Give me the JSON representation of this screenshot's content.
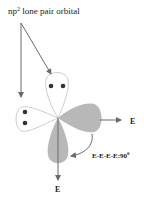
{
  "title": {
    "prefix": "np",
    "superscript": "2",
    "suffix": " lone pair orbital"
  },
  "labels": {
    "right_E": "E",
    "bottom_E": "E",
    "angle": "E-E-E-E:90",
    "angle_deg": "0"
  },
  "colors": {
    "shaded": "#b8b8b8",
    "arrow": "#6a6a6a",
    "outline": "#999999",
    "dot": "#333333"
  }
}
